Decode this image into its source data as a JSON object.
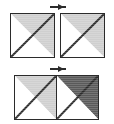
{
  "figure": {
    "width": 114,
    "height": 124,
    "background": "#ffffff",
    "outline_color": "#2b2b2b",
    "marker_color": "#2b2b2b",
    "shading": {
      "white": "#ffffff",
      "light_gray": "#cfcfcf",
      "dark_gray": "#5a5a5a"
    }
  },
  "rows": [
    {
      "name": "top-row",
      "marker": "right-arrow-marker",
      "layout": "separated",
      "squares": [
        {
          "name": "square-top-left",
          "upper_triangle_fill": "#ffffff",
          "lower_triangle_fill": "#cfcfcf",
          "diagonal": "bottom-left-to-top-right"
        },
        {
          "name": "square-top-right",
          "upper_triangle_fill": "#ffffff",
          "lower_triangle_fill": "#cfcfcf",
          "diagonal": "bottom-left-to-top-right"
        }
      ]
    },
    {
      "name": "bottom-row",
      "marker": "right-arrow-marker",
      "layout": "adjacent",
      "squares": [
        {
          "name": "square-bottom-left",
          "upper_triangle_fill": "#ffffff",
          "lower_triangle_fill": "#cfcfcf",
          "diagonal": "bottom-left-to-top-right"
        },
        {
          "name": "square-bottom-right",
          "upper_triangle_fill": "#ffffff",
          "lower_triangle_fill": "#5a5a5a",
          "diagonal": "bottom-left-to-top-right"
        }
      ]
    }
  ]
}
